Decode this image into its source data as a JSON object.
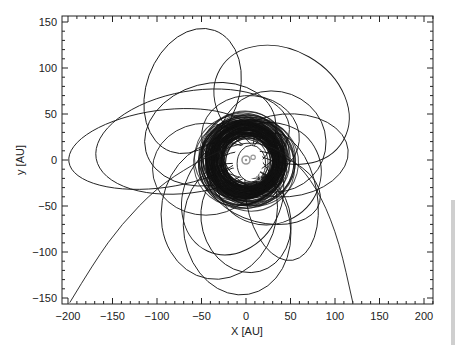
{
  "chart_data": {
    "type": "scatter",
    "title": "",
    "xlabel": "X [AU]",
    "ylabel": "y [AU]",
    "xlim": [
      -207,
      210
    ],
    "ylim": [
      -156,
      156
    ],
    "x_ticks": [
      -200,
      -150,
      -100,
      -50,
      0,
      50,
      100,
      150,
      200
    ],
    "y_ticks": [
      -150,
      -100,
      -50,
      0,
      50,
      100,
      150
    ],
    "x_tick_labels": [
      "−200",
      "−150",
      "−100",
      "−50",
      "0",
      "50",
      "100",
      "150",
      "200"
    ],
    "y_tick_labels": [
      "−150",
      "−100",
      "−50",
      "0",
      "50",
      "100",
      "150"
    ],
    "grid": false,
    "legend": null,
    "central_body": {
      "symbol": "sun",
      "x": 0,
      "y": 0
    },
    "markers": [
      {
        "label": "planet",
        "x": 8,
        "y": 3
      },
      {
        "label": "planet",
        "x": 14,
        "y": -20
      }
    ],
    "dense_ring": {
      "inner_radius_au": 20,
      "outer_radius_au": 45,
      "center": [
        0,
        0
      ]
    },
    "series": [
      {
        "name": "orbit-1",
        "cx": -60,
        "cy": 75,
        "rx": 52,
        "ry": 70,
        "rot": -20
      },
      {
        "name": "orbit-2",
        "cx": 40,
        "cy": 60,
        "rx": 80,
        "ry": 60,
        "rot": -30
      },
      {
        "name": "orbit-3",
        "cx": -95,
        "cy": 12,
        "rx": 105,
        "ry": 42,
        "rot": 8
      },
      {
        "name": "orbit-4",
        "cx": -60,
        "cy": 20,
        "rx": 110,
        "ry": 55,
        "rot": 10
      },
      {
        "name": "orbit-5",
        "cx": -40,
        "cy": 28,
        "rx": 75,
        "ry": 55,
        "rot": 15
      },
      {
        "name": "orbit-6",
        "cx": 30,
        "cy": 20,
        "rx": 60,
        "ry": 55,
        "rot": -10
      },
      {
        "name": "orbit-7",
        "cx": 45,
        "cy": 5,
        "rx": 70,
        "ry": 45,
        "rot": 5
      },
      {
        "name": "orbit-8",
        "cx": 25,
        "cy": -15,
        "rx": 60,
        "ry": 55,
        "rot": 25
      },
      {
        "name": "orbit-9",
        "cx": -15,
        "cy": -40,
        "rx": 55,
        "ry": 65,
        "rot": -25
      },
      {
        "name": "orbit-10",
        "cx": -30,
        "cy": -55,
        "rx": 65,
        "ry": 75,
        "rot": -10
      },
      {
        "name": "orbit-11",
        "cx": -10,
        "cy": -75,
        "rx": 60,
        "ry": 72,
        "rot": 10
      },
      {
        "name": "orbit-12",
        "cx": 0,
        "cy": -65,
        "rx": 50,
        "ry": 58,
        "rot": 15
      },
      {
        "name": "orbit-13",
        "cx": 40,
        "cy": -40,
        "rx": 40,
        "ry": 70,
        "rot": 10
      },
      {
        "name": "orbit-14",
        "cx": -45,
        "cy": -10,
        "rx": 60,
        "ry": 50,
        "rot": 0
      },
      {
        "name": "orbit-15",
        "cx": 5,
        "cy": 25,
        "rx": 55,
        "ry": 45,
        "rot": -5
      },
      {
        "name": "orbit-16",
        "cx": 20,
        "cy": -30,
        "rx": 65,
        "ry": 38,
        "rot": -15
      }
    ],
    "escape_trajectory": {
      "name": "hyperbolic",
      "points": [
        [
          -198,
          -155
        ],
        [
          -170,
          -110
        ],
        [
          -140,
          -70
        ],
        [
          -100,
          -30
        ],
        [
          -60,
          -5
        ],
        [
          -30,
          10
        ],
        [
          0,
          20
        ],
        [
          30,
          15
        ],
        [
          60,
          -5
        ],
        [
          85,
          -40
        ],
        [
          105,
          -90
        ],
        [
          120,
          -155
        ]
      ]
    }
  }
}
